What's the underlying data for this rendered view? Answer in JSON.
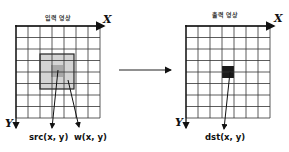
{
  "input_panel": {
    "title": "입력 영상",
    "x_axis_label": "X",
    "y_axis_label": "Y",
    "src_label": "src(x, y)",
    "w_label": "w(x, y)"
  },
  "output_panel": {
    "title": "출력 영상",
    "x_axis_label": "X",
    "y_axis_label": "Y",
    "dst_label": "dst(x, y)"
  },
  "grid": {
    "cols": 7,
    "rows": 8
  },
  "colors": {
    "grid_line": "#333333",
    "window_fill": "#d4d4d4",
    "center_fill": "#a8a8a8",
    "output_pixel": "#1a1a1a"
  }
}
